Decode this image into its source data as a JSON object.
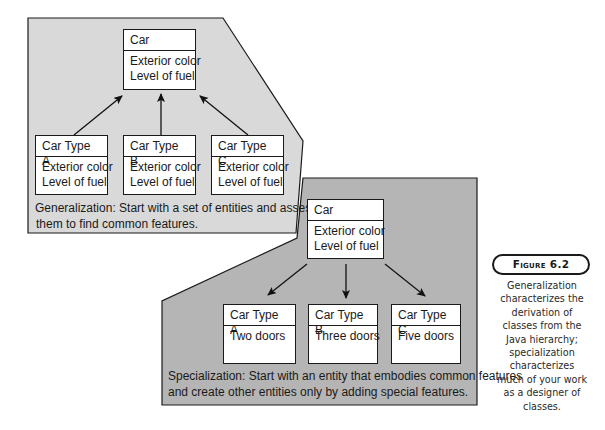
{
  "generalization": {
    "parent": {
      "title": "Car",
      "attributes": [
        "Exterior color",
        "Level of fuel"
      ]
    },
    "children": [
      {
        "title": "Car Type A",
        "attributes": [
          "Exterior color",
          "Level of fuel"
        ]
      },
      {
        "title": "Car Type B",
        "attributes": [
          "Exterior color",
          "Level of fuel"
        ]
      },
      {
        "title": "Car Type C",
        "attributes": [
          "Exterior color",
          "Level of fuel"
        ]
      }
    ],
    "caption_line1": "Generalization: Start with a set of entities and assess",
    "caption_line2": "them to find common features.",
    "panel_color": "#d9d9d9"
  },
  "specialization": {
    "parent": {
      "title": "Car",
      "attributes": [
        "Exterior color",
        "Level of fuel"
      ]
    },
    "children": [
      {
        "title": "Car Type A",
        "attributes": [
          "Two doors"
        ]
      },
      {
        "title": "Car Type B",
        "attributes": [
          "Three doors"
        ]
      },
      {
        "title": "Car Type C",
        "attributes": [
          "Five doors"
        ]
      }
    ],
    "caption_line1": "Specialization: Start with an entity that embodies common features",
    "caption_line2": "and create other entities only by adding special features.",
    "panel_color": "#b5b5b5"
  },
  "figure": {
    "label": "Figure 6.2",
    "description": "Generalization characterizes the derivation of classes from the Java hierarchy; specialization characterizes much of your work as a designer of classes.",
    "description_lines": [
      "Generalization",
      "characterizes the",
      "derivation of",
      "classes from the",
      "Java hierarchy;",
      "specialization",
      "characterizes",
      "much of your work",
      "as a designer of",
      "classes."
    ]
  }
}
